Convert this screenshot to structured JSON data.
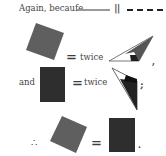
{
  "line1": {
    "text": "Again, becaufe",
    "parallel_symbol": "||"
  },
  "row2": {
    "equals": "=",
    "word": "twice",
    "punct": ","
  },
  "row3": {
    "lead": "and",
    "equals": "=",
    "word": "twice",
    "punct": ";"
  },
  "row4": {
    "therefore": "∴",
    "equals": "=",
    "punct": "."
  },
  "colors": {
    "square_gray": "#5f5f5f",
    "rect_dark": "#2e2e2e",
    "triangle_gray": "#555555",
    "triangle_dark": "#1f1f1f",
    "line_gray": "#9a9a9a"
  }
}
